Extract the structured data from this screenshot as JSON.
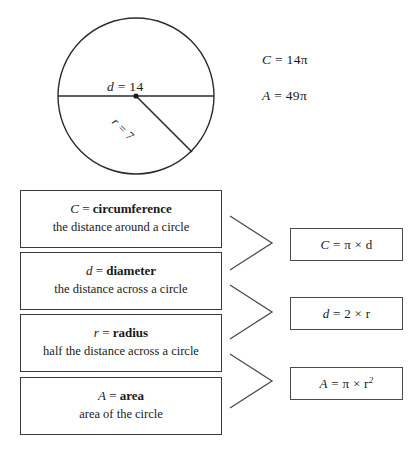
{
  "figure": {
    "shape": "circle",
    "diameter_label": "d = 14",
    "diameter_symbol": "d",
    "diameter_value": "= 14",
    "radius_symbol": "r",
    "radius_value": "= 7",
    "radius_label": "r = 7",
    "center_dot": "center-point",
    "stroke_color": "#2b2b2b"
  },
  "worked_values": [
    {
      "symbol": "C",
      "expression": "= 14π",
      "full": "C = 14π"
    },
    {
      "symbol": "A",
      "expression": "= 49π",
      "full": "A = 49π"
    }
  ],
  "definitions": [
    {
      "symbol": "C",
      "equals": "=",
      "term": "circumference",
      "description": "the distance around a circle"
    },
    {
      "symbol": "d",
      "equals": "=",
      "term": "diameter",
      "description": "the distance across a circle"
    },
    {
      "symbol": "r",
      "equals": "=",
      "term": "radius",
      "description": "half the distance across a circle"
    },
    {
      "symbol": "A",
      "equals": "=",
      "term": "area",
      "description": "area of the circle"
    }
  ],
  "formulas": [
    {
      "lhs": "C",
      "rhs": "= π × d",
      "rhs_base": "= π × d",
      "exponent": "",
      "full": "C = π × d"
    },
    {
      "lhs": "d",
      "rhs": "= 2 × r",
      "rhs_base": "= 2 × r",
      "exponent": "",
      "full": "d = 2 × r"
    },
    {
      "lhs": "A",
      "rhs": "= π × r²",
      "rhs_base": "= π × r",
      "exponent": "2",
      "full": "A = π × r²"
    }
  ],
  "connectors": [
    {
      "name": "chevron-circumference-to-formula"
    },
    {
      "name": "chevron-diameter-radius-to-formula"
    },
    {
      "name": "chevron-radius-area-to-formula"
    }
  ],
  "colors": {
    "background": "#ffffff",
    "ink": "#1a1a1a",
    "box_border": "#3a3a3a",
    "formula_border": "#4a4a4a",
    "circle_stroke": "#2b2b2b"
  }
}
